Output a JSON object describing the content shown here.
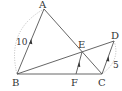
{
  "diagram": {
    "type": "geometry",
    "points": {
      "A": {
        "label": "A",
        "x": 44,
        "y": 9
      },
      "B": {
        "label": "B",
        "x": 17,
        "y": 74
      },
      "C": {
        "label": "C",
        "x": 102,
        "y": 74
      },
      "D": {
        "label": "D",
        "x": 114,
        "y": 41
      },
      "E": {
        "label": "E",
        "x": 82,
        "y": 52
      },
      "F": {
        "label": "F",
        "x": 76,
        "y": 74
      }
    },
    "segments": [
      "AB",
      "BC",
      "AC",
      "BD",
      "CD",
      "EF"
    ],
    "parallel_marks": [
      "AB",
      "EF",
      "CD"
    ],
    "lengths": {
      "AB": "10",
      "CD": "5"
    },
    "dotted_arcs": [
      "A-B",
      "D-C"
    ],
    "colors": {
      "line": "#555555",
      "dotted": "#aaaaaa",
      "text": "#333333"
    }
  }
}
